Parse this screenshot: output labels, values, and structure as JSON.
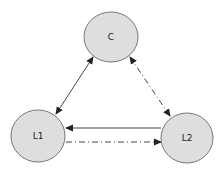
{
  "diagram": {
    "colors": {
      "node_fill": "#dedede",
      "node_stroke": "#777777",
      "edge_stroke": "#444444",
      "label": "#222222"
    },
    "nodes": [
      {
        "id": "C",
        "label": "C",
        "cx": 111,
        "cy": 37,
        "rx": 27,
        "ry": 25
      },
      {
        "id": "L1",
        "label": "L1",
        "cx": 38,
        "cy": 136,
        "rx": 27,
        "ry": 26
      },
      {
        "id": "L2",
        "label": "L2",
        "cx": 187,
        "cy": 138,
        "rx": 26,
        "ry": 25
      }
    ],
    "edges": [
      {
        "from": "C",
        "to": "L1",
        "style": "solid",
        "direction": "both",
        "x1": 93,
        "y1": 57,
        "x2": 56,
        "y2": 114
      },
      {
        "from": "C",
        "to": "L2",
        "style": "dash-dot",
        "direction": "both",
        "x1": 130,
        "y1": 57,
        "x2": 170,
        "y2": 116
      },
      {
        "from": "L2",
        "to": "L1",
        "style": "solid",
        "direction": "forward",
        "x1": 161,
        "y1": 128,
        "x2": 66,
        "y2": 128
      },
      {
        "from": "L1",
        "to": "L2",
        "style": "dash-dot",
        "direction": "forward",
        "x1": 66,
        "y1": 142,
        "x2": 161,
        "y2": 142
      }
    ]
  }
}
